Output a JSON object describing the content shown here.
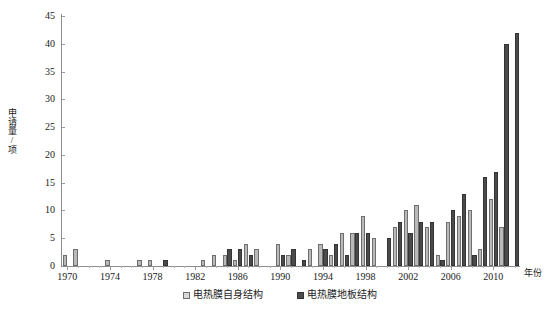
{
  "chart_data": {
    "type": "bar",
    "title": "",
    "subtitle": "",
    "xlabel": "年份",
    "ylabel": "申请量/项",
    "ylim": [
      0,
      45
    ],
    "ytick_step": 5,
    "yticks": [
      0,
      5,
      10,
      15,
      20,
      25,
      30,
      35,
      40,
      45
    ],
    "grid": false,
    "legend_position": "bottom-center",
    "xtick_labels": [
      "1970",
      "1974",
      "1978",
      "1982",
      "1986",
      "1990",
      "1994",
      "1998",
      "2002",
      "2006",
      "2010"
    ],
    "xtick_step_years": 4,
    "categories": [
      "1970",
      "1971",
      "1972",
      "1973",
      "1974",
      "1975",
      "1976",
      "1977",
      "1978",
      "1979",
      "1980",
      "1981",
      "1982",
      "1983",
      "1984",
      "1985",
      "1986",
      "1987",
      "1988",
      "1989",
      "1990",
      "1991",
      "1992",
      "1993",
      "1994",
      "1995",
      "1996",
      "1997",
      "1998",
      "1999",
      "2000",
      "2001",
      "2002",
      "2003",
      "2004",
      "2005",
      "2006",
      "2007",
      "2008",
      "2009",
      "2010",
      "2011",
      "2012"
    ],
    "series": [
      {
        "name": "电热膜自身结构",
        "color": "#b9b9b9",
        "edge_color": "#6e6e6e",
        "values": [
          2,
          3,
          0,
          0,
          1,
          0,
          0,
          1,
          1,
          0,
          0,
          0,
          0,
          1,
          2,
          2,
          1,
          4,
          3,
          0,
          4,
          2,
          0,
          3,
          4,
          2,
          6,
          6,
          9,
          5,
          0,
          7,
          10,
          11,
          7,
          2,
          8,
          9,
          10,
          3,
          12,
          7,
          0
        ]
      },
      {
        "name": "电热膜地板结构",
        "color": "#4b4b4b",
        "edge_color": "#343434",
        "values": [
          0,
          0,
          0,
          0,
          0,
          0,
          0,
          0,
          0,
          1,
          0,
          0,
          0,
          0,
          0,
          3,
          3,
          2,
          0,
          0,
          2,
          3,
          1,
          0,
          3,
          4,
          2,
          6,
          6,
          0,
          5,
          8,
          6,
          8,
          8,
          1,
          10,
          13,
          2,
          16,
          17,
          40,
          42
        ]
      }
    ]
  },
  "legend": {
    "items": [
      {
        "label": "电热膜自身结构"
      },
      {
        "label": "电热膜地板结构"
      }
    ]
  }
}
